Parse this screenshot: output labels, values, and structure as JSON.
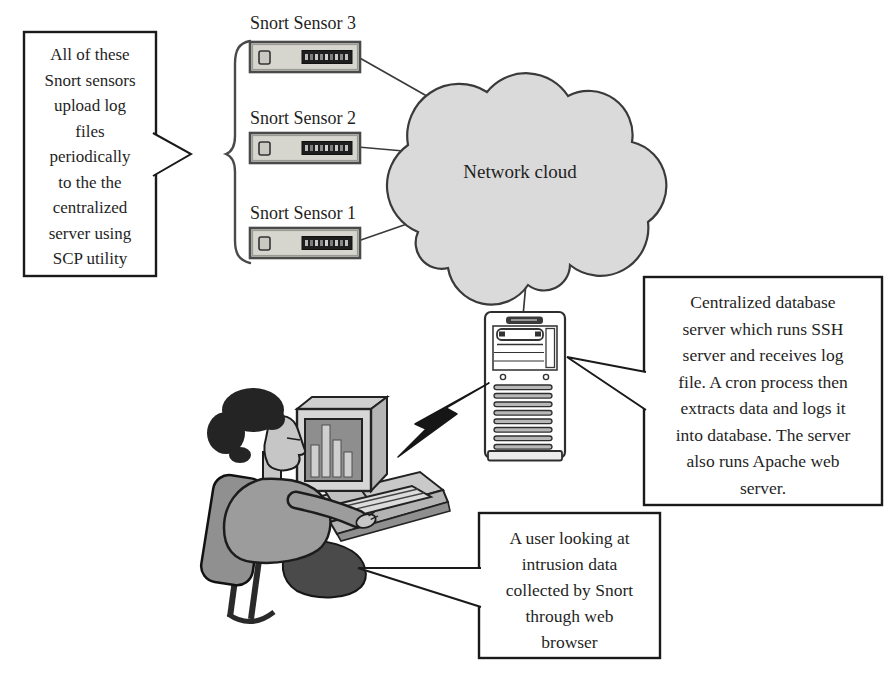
{
  "callouts": {
    "upload_note": {
      "text": "All of these\nSnort sensors\nupload log\nfiles\nperiodically\nto the the\ncentralized\nserver using\nSCP utility"
    },
    "server_note": {
      "text": "Centralized database\nserver which runs SSH\nserver and receives log\nfile. A cron process then\nextracts data and logs it\ninto database. The server\nalso runs Apache web\nserver."
    },
    "user_note": {
      "text": "A user looking at\nintrusion data\ncollected by Snort\nthrough web\nbrowser"
    }
  },
  "nodes": {
    "sensor3": {
      "label": "Snort Sensor 3"
    },
    "sensor2": {
      "label": "Snort Sensor 2"
    },
    "sensor1": {
      "label": "Snort Sensor 1"
    },
    "cloud": {
      "label": "Network cloud"
    }
  },
  "figures": {
    "sensors": [
      "snort-sensor-3-device",
      "snort-sensor-2-device",
      "snort-sensor-1-device"
    ],
    "cloud": "network-cloud-shape",
    "server": "server-tower-icon",
    "lightning": "lightning-bolt-icon",
    "user": "user-at-computer-figure",
    "brace": "curly-brace"
  },
  "colors": {
    "background": "#ffffff",
    "text": "#1f1f1f",
    "box_border": "#1a1a1a",
    "cloud_fill": "#dadada",
    "device_fill": "#d6d6cf",
    "device_display": "#1e1e1e",
    "outline": "#3a3a3a",
    "bolt": "#161616"
  }
}
